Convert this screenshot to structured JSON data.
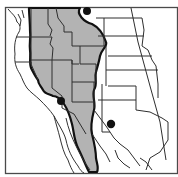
{
  "map": {
    "title": "Species range map — western North America",
    "colors": {
      "range_fill": "#b3b3b3",
      "range_outline": "#111111",
      "borders": "#2e2e2e",
      "background": "#ffffff",
      "occurrence_dot": "#111111"
    },
    "regions_shown": [
      "western United States",
      "Baja California",
      "northwestern Mexico",
      "Texas",
      "Great Plains"
    ],
    "range": {
      "label": "Distribution range",
      "description": "Shaded range from the northern border south through the Intermountain West and Rockies into northwestern Mexico"
    },
    "occurrences": [
      {
        "label": "Isolated occurrence north",
        "x": 87,
        "y": 11
      },
      {
        "label": "Isolated occurrence southern California",
        "x": 61,
        "y": 101
      },
      {
        "label": "Isolated occurrence Texas Panhandle",
        "x": 111,
        "y": 124
      }
    ]
  }
}
